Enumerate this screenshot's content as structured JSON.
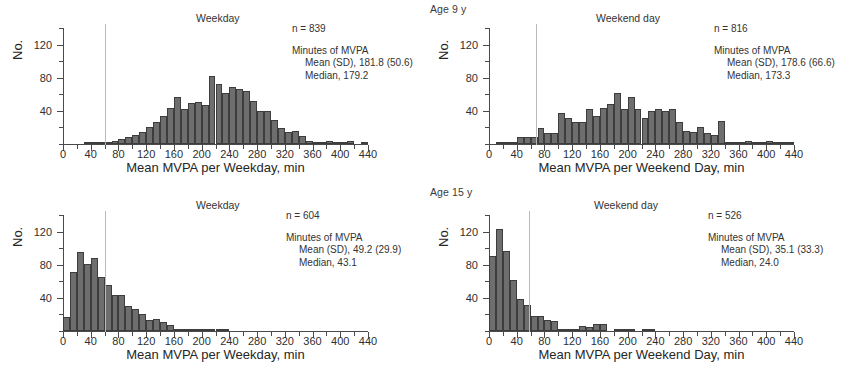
{
  "figure": {
    "group_labels": [
      {
        "id": "age9",
        "text": "Age 9 y"
      },
      {
        "id": "age15",
        "text": "Age 15 y"
      }
    ]
  },
  "chart_data": [
    {
      "id": "age9-weekday",
      "type": "bar",
      "title": "Weekday",
      "group": "Age 9 y",
      "xlabel": "Mean MVPA per Weekday, min",
      "ylabel": "No.",
      "xlim": [
        0,
        440
      ],
      "ylim": [
        0,
        140
      ],
      "xticks": [
        0,
        40,
        80,
        120,
        160,
        200,
        240,
        280,
        320,
        360,
        400,
        440
      ],
      "xtick_step_minor": 20,
      "yticks": [
        40,
        80,
        120
      ],
      "ytick_step_minor": 20,
      "grid": false,
      "bin_width": 10,
      "reference_line_x": 60,
      "annotations": {
        "n_label": "n = 839",
        "stats_header": "Minutes of MVPA",
        "mean_sd": "Mean (SD), 181.8 (50.6)",
        "median": "Median, 179.2"
      },
      "x": [
        5,
        15,
        25,
        35,
        45,
        55,
        65,
        75,
        85,
        95,
        105,
        115,
        125,
        135,
        145,
        155,
        165,
        175,
        185,
        195,
        205,
        215,
        225,
        235,
        245,
        255,
        265,
        275,
        285,
        295,
        305,
        315,
        325,
        335,
        345,
        355,
        365,
        375,
        385,
        395,
        405,
        415,
        425,
        435
      ],
      "values": [
        0,
        0,
        0,
        1,
        1,
        1,
        2,
        4,
        6,
        8,
        11,
        15,
        21,
        26,
        34,
        44,
        57,
        42,
        49,
        51,
        47,
        82,
        72,
        61,
        69,
        67,
        64,
        52,
        40,
        40,
        29,
        19,
        14,
        16,
        10,
        4,
        3,
        3,
        4,
        2,
        1,
        4,
        0,
        1
      ]
    },
    {
      "id": "age9-weekend",
      "type": "bar",
      "title": "Weekend day",
      "group": "Age 9 y",
      "xlabel": "Mean MVPA per Weekend Day, min",
      "ylabel": "No.",
      "xlim": [
        0,
        440
      ],
      "ylim": [
        0,
        140
      ],
      "xticks": [
        0,
        40,
        80,
        120,
        160,
        200,
        240,
        280,
        320,
        360,
        400,
        440
      ],
      "xtick_step_minor": 20,
      "yticks": [
        40,
        80,
        120
      ],
      "ytick_step_minor": 20,
      "grid": false,
      "bin_width": 10,
      "reference_line_x": 68,
      "annotations": {
        "n_label": "n = 816",
        "stats_header": "Minutes of MVPA",
        "mean_sd": "Mean (SD), 178.6 (66.6)",
        "median": "Median, 173.3"
      },
      "x": [
        5,
        15,
        25,
        35,
        45,
        55,
        65,
        75,
        85,
        95,
        105,
        115,
        125,
        135,
        145,
        155,
        165,
        175,
        185,
        195,
        205,
        215,
        225,
        235,
        245,
        255,
        265,
        275,
        285,
        295,
        305,
        315,
        325,
        335,
        345,
        355,
        365,
        375,
        385,
        395,
        405,
        415,
        425,
        435
      ],
      "values": [
        0,
        2,
        2,
        1,
        9,
        9,
        9,
        19,
        13,
        13,
        38,
        31,
        27,
        26,
        42,
        34,
        44,
        48,
        61,
        42,
        57,
        42,
        31,
        40,
        42,
        40,
        42,
        26,
        16,
        15,
        20,
        13,
        11,
        28,
        2,
        2,
        1,
        4,
        1,
        1,
        4,
        1,
        1,
        3
      ]
    },
    {
      "id": "age15-weekday",
      "type": "bar",
      "title": "Weekday",
      "group": "Age 15 y",
      "xlabel": "Mean MVPA per Weekday, min",
      "ylabel": "No.",
      "xlim": [
        0,
        440
      ],
      "ylim": [
        0,
        140
      ],
      "xticks": [
        0,
        40,
        80,
        120,
        160,
        200,
        240,
        280,
        320,
        360,
        400,
        440
      ],
      "xtick_step_minor": 20,
      "yticks": [
        40,
        80,
        120
      ],
      "ytick_step_minor": 20,
      "grid": false,
      "bin_width": 10,
      "reference_line_x": 60,
      "annotations": {
        "n_label": "n = 604",
        "stats_header": "Minutes of MVPA",
        "mean_sd": "Mean (SD), 49.2 (29.9)",
        "median": "Median, 43.1"
      },
      "x": [
        5,
        15,
        25,
        35,
        45,
        55,
        65,
        75,
        85,
        95,
        105,
        115,
        125,
        135,
        145,
        155,
        165,
        175,
        185,
        195,
        205,
        215,
        225,
        235,
        245,
        255,
        265,
        275,
        285,
        295,
        305,
        315,
        325,
        335,
        345,
        355,
        365,
        375,
        385,
        395,
        405,
        415,
        425,
        435
      ],
      "values": [
        17,
        71,
        95,
        81,
        88,
        65,
        55,
        44,
        43,
        30,
        26,
        21,
        13,
        14,
        11,
        7,
        2,
        1,
        1,
        1,
        1,
        1,
        3,
        1,
        0,
        0,
        0,
        0,
        0,
        0,
        0,
        0,
        0,
        0,
        0,
        0,
        0,
        0,
        0,
        0,
        0,
        0,
        0,
        0
      ]
    },
    {
      "id": "age15-weekend",
      "type": "bar",
      "title": "Weekend day",
      "group": "Age 15 y",
      "xlabel": "Mean MVPA per Weekend Day, min",
      "ylabel": "No.",
      "xlim": [
        0,
        440
      ],
      "ylim": [
        0,
        140
      ],
      "xticks": [
        0,
        40,
        80,
        120,
        160,
        200,
        240,
        280,
        320,
        360,
        400,
        440
      ],
      "xtick_step_minor": 20,
      "yticks": [
        40,
        80,
        120
      ],
      "ytick_step_minor": 20,
      "grid": false,
      "bin_width": 10,
      "reference_line_x": 58,
      "annotations": {
        "n_label": "n = 526",
        "stats_header": "Minutes of MVPA",
        "mean_sd": "Mean (SD), 35.1 (33.3)",
        "median": "Median, 24.0"
      },
      "x": [
        5,
        15,
        25,
        35,
        45,
        55,
        65,
        75,
        85,
        95,
        105,
        115,
        125,
        135,
        145,
        155,
        165,
        175,
        185,
        195,
        205,
        215,
        225,
        235,
        245,
        255,
        265,
        275,
        285,
        295,
        305,
        315,
        325,
        335,
        345,
        355,
        365,
        375,
        385,
        395,
        405,
        415,
        425,
        435
      ],
      "values": [
        90,
        123,
        96,
        62,
        39,
        31,
        18,
        18,
        13,
        12,
        3,
        2,
        2,
        6,
        5,
        8,
        8,
        0,
        1,
        2,
        1,
        0,
        1,
        2,
        0,
        0,
        0,
        0,
        0,
        0,
        0,
        0,
        0,
        0,
        0,
        0,
        0,
        0,
        0,
        0,
        0,
        0,
        0,
        0
      ]
    }
  ]
}
